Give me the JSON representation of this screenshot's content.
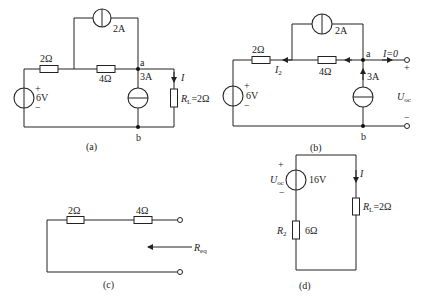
{
  "circuit_a": {
    "caption": "(a)",
    "top_source": "2A",
    "r1": "2Ω",
    "r2": "4Ω",
    "node_a": "a",
    "node_b": "b",
    "mid_source": "3A",
    "voltage_source": "6V",
    "plus": "+",
    "minus": "−",
    "current": "I",
    "load_R": "R",
    "load_sub": "L",
    "load_value": "=2Ω"
  },
  "circuit_b": {
    "caption": "(b)",
    "top_source": "2A",
    "r1": "2Ω",
    "r2": "4Ω",
    "node_a": "a",
    "node_b": "b",
    "mid_source": "3A",
    "voltage_source": "6V",
    "plus": "+",
    "minus": "−",
    "current_I2": "I",
    "current_I2_sub": "2",
    "current_open": "I=0",
    "uoc": "U",
    "uoc_sub": "oc",
    "term_plus": "+",
    "term_minus": "−"
  },
  "circuit_c": {
    "caption": "(c)",
    "r1": "2Ω",
    "r2": "4Ω",
    "req": "R",
    "req_sub": "eq"
  },
  "circuit_d": {
    "caption": "(d)",
    "uoc": "U",
    "uoc_sub": "oc",
    "plus": "+",
    "minus": "−",
    "source_value": "16V",
    "current": "I",
    "r2_label": "R",
    "r2_sub": "2",
    "r2_value": "6Ω",
    "load_R": "R",
    "load_sub": "L",
    "load_value": "=2Ω"
  }
}
